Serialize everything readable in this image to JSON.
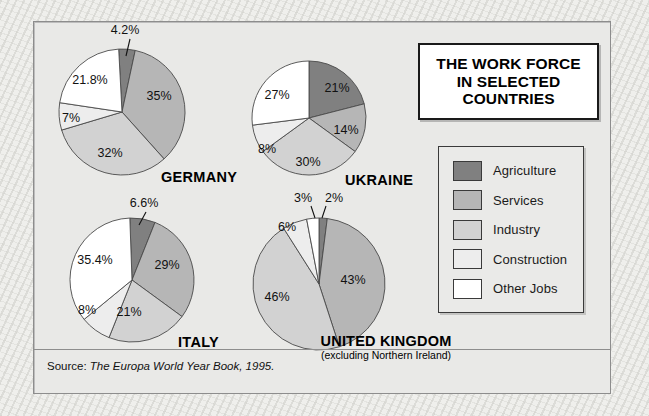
{
  "title": {
    "line1": "THE WORK FORCE",
    "line2": "IN SELECTED",
    "line3": "COUNTRIES"
  },
  "legend": {
    "items": [
      {
        "label": "Agriculture",
        "color": "#808080"
      },
      {
        "label": "Services",
        "color": "#b6b6b6"
      },
      {
        "label": "Industry",
        "color": "#d2d2d2"
      },
      {
        "label": "Construction",
        "color": "#ededed"
      },
      {
        "label": "Other Jobs",
        "color": "#ffffff"
      }
    ]
  },
  "captions": {
    "germany": "GERMANY",
    "ukraine": "UKRAINE",
    "italy": "ITALY",
    "uk": "UNITED KINGDOM",
    "uk_sub": "(excluding Northern Ireland)"
  },
  "source": {
    "prefix": "Source: ",
    "work": "The Europa World Year Book, 1995."
  },
  "chart_data": {
    "type": "pie",
    "title": "THE WORK FORCE IN SELECTED COUNTRIES",
    "legend_position": "right",
    "categories": [
      "Agriculture",
      "Services",
      "Industry",
      "Construction",
      "Other Jobs"
    ],
    "colors": [
      "#808080",
      "#b6b6b6",
      "#d2d2d2",
      "#ededed",
      "#ffffff"
    ],
    "units": "percent of work force",
    "charts": [
      {
        "name": "GERMANY",
        "values": [
          4.2,
          35,
          32,
          7,
          21.8
        ],
        "labels": [
          "4.2%",
          "35%",
          "32%",
          "7%",
          "21.8%"
        ],
        "leader_line": "4.2%"
      },
      {
        "name": "UKRAINE",
        "values": [
          21,
          14,
          30,
          8,
          27
        ],
        "labels": [
          "21%",
          "14%",
          "30%",
          "8%",
          "27%"
        ],
        "leader_line": null
      },
      {
        "name": "ITALY",
        "values": [
          6.6,
          29,
          21,
          8,
          35.4
        ],
        "labels": [
          "6.6%",
          "29%",
          "21%",
          "8%",
          "35.4%"
        ],
        "leader_line": "6.6%"
      },
      {
        "name": "UNITED KINGDOM",
        "subtitle": "(excluding Northern Ireland)",
        "values": [
          2,
          43,
          46,
          6,
          3
        ],
        "labels": [
          "2%",
          "43%",
          "46%",
          "6%",
          "3%"
        ],
        "leader_line": "3% 2%"
      }
    ],
    "source": "Source: The Europa World Year Book, 1995."
  },
  "pie_labels": {
    "germany": {
      "agriculture": "4.2%",
      "services": "35%",
      "industry": "32%",
      "construction": "7%",
      "other": "21.8%"
    },
    "ukraine": {
      "agriculture": "21%",
      "services": "14%",
      "industry": "30%",
      "construction": "8%",
      "other": "27%"
    },
    "italy": {
      "agriculture": "6.6%",
      "services": "29%",
      "industry": "21%",
      "construction": "8%",
      "other": "35.4%"
    },
    "uk": {
      "agriculture": "2%",
      "services": "43%",
      "industry": "46%",
      "construction": "6%",
      "other": "3%"
    }
  }
}
